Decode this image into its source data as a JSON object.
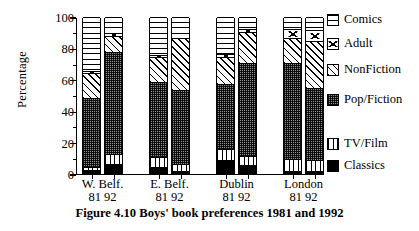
{
  "figure": {
    "caption": "Figure 4.10   Boys' book preferences 1981  and  1992"
  },
  "axes": {
    "ylabel": "Percentage",
    "yticks": [
      "0",
      "20",
      "40",
      "60",
      "80",
      "100"
    ],
    "ylim": [
      0,
      100
    ],
    "ytick_minor_step": 10,
    "grid": false
  },
  "legend": {
    "position": "right",
    "items": [
      {
        "label": "Comics",
        "pattern": "horizontal-stripes"
      },
      {
        "label": "Adult",
        "pattern": "white-with-mark"
      },
      {
        "label": "NonFiction",
        "pattern": "diagonal-hatch"
      },
      {
        "label": "Pop/Fiction",
        "pattern": "stipple-gray"
      },
      {
        "label": "TV/Film",
        "pattern": "vertical-stripes"
      },
      {
        "label": "Classics",
        "pattern": "solid-black"
      }
    ]
  },
  "groups": [
    {
      "name": "W. Belf.",
      "years": "81  92"
    },
    {
      "name": "E. Belf.",
      "years": "81  92"
    },
    {
      "name": "Dublin",
      "years": "81  92"
    },
    {
      "name": "London",
      "years": "81  92"
    }
  ],
  "chart_data": {
    "type": "bar",
    "subtype": "stacked-100-percent",
    "title": "Boys' book preferences 1981 and 1992",
    "xlabel": "",
    "ylabel": "Percentage",
    "ylim": [
      0,
      100
    ],
    "categories": [
      "W. Belf. 81",
      "W. Belf. 92",
      "E. Belf. 81",
      "E. Belf. 92",
      "Dublin 81",
      "Dublin 92",
      "London 81",
      "London 92"
    ],
    "series": [
      {
        "name": "Classics",
        "values": [
          2,
          6,
          4,
          1,
          8,
          5,
          1,
          1
        ]
      },
      {
        "name": "TV/Film",
        "values": [
          2,
          6,
          6,
          5,
          7,
          6,
          8,
          7
        ]
      },
      {
        "name": "Pop/Fiction",
        "values": [
          44,
          65,
          48,
          47,
          42,
          59,
          61,
          46
        ]
      },
      {
        "name": "NonFiction",
        "values": [
          16,
          10,
          16,
          33,
          17,
          20,
          16,
          30
        ]
      },
      {
        "name": "Adult",
        "values": [
          1,
          2,
          1,
          0,
          2,
          2,
          6,
          7
        ]
      },
      {
        "name": "Comics",
        "values": [
          35,
          11,
          25,
          14,
          24,
          8,
          8,
          9
        ]
      }
    ],
    "stack_order_bottom_to_top": [
      "Classics",
      "TV/Film",
      "Pop/Fiction",
      "NonFiction",
      "Adult",
      "Comics"
    ]
  }
}
